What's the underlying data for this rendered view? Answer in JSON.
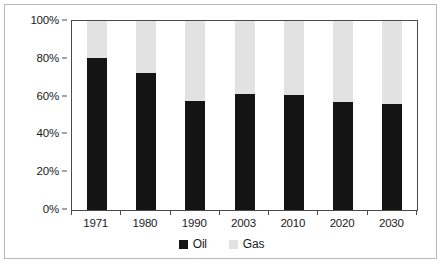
{
  "chart_data": {
    "type": "bar",
    "subtype": "stacked-bar-percent",
    "title": "",
    "subtitle": "",
    "xlabel": "",
    "ylabel": "",
    "categories": [
      "1971",
      "1980",
      "1990",
      "2003",
      "2010",
      "2020",
      "2030"
    ],
    "series": [
      {
        "name": "Oil",
        "color": "#141414",
        "values": [
          80.3,
          72.6,
          57.7,
          61.4,
          60.6,
          56.9,
          55.9
        ]
      },
      {
        "name": "Gas",
        "color": "#e2e2e2",
        "values": [
          19.7,
          27.4,
          42.3,
          38.6,
          39.4,
          43.1,
          44.1
        ]
      }
    ],
    "ylim": [
      0,
      100
    ],
    "y_ticks": [
      0,
      20,
      40,
      60,
      80,
      100
    ],
    "y_tick_labels": [
      "0%",
      "20%",
      "40%",
      "60%",
      "80%",
      "100%"
    ],
    "grid": false,
    "legend_position": "bottom-center",
    "legend": [
      {
        "label": "Oil",
        "color": "#141414"
      },
      {
        "label": "Gas",
        "color": "#e2e2e2"
      }
    ]
  },
  "colors": {
    "oil": "#141414",
    "gas": "#e2e2e2",
    "axis": "#4a4a4a",
    "frame": "#b9b9b9",
    "text": "#1a1a1a"
  }
}
